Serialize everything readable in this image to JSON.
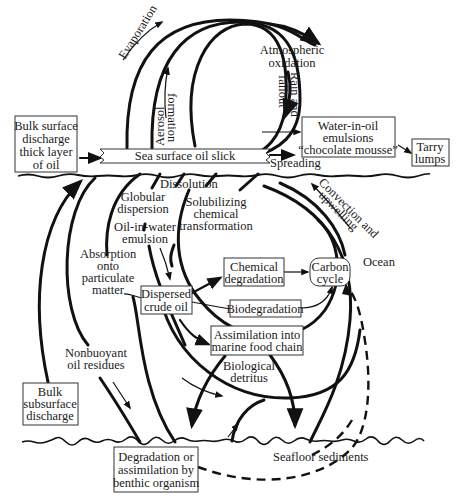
{
  "diagram": {
    "surface": {
      "slick_label": "Sea surface oil slick",
      "spreading_label": "Spreading"
    },
    "atmosphere": {
      "evaporation": "Evaporation",
      "aerosol_line1": "Aerosol",
      "aerosol_line2": "formation",
      "atmo_line1": "Atmospheric",
      "atmo_line2": "oxidation",
      "rain_line1": "Rain and",
      "rain_line2": "fallout"
    },
    "boxes": {
      "bulk_surface": [
        "Bulk surface",
        "discharge",
        "thick layer",
        "of oil"
      ],
      "emulsions": [
        "Water-in-oil",
        "emulsions",
        "“chocolate mousse”"
      ],
      "tarry": [
        "Tarry",
        "lumps"
      ],
      "dispersed": [
        "Dispersed",
        "crude oil"
      ],
      "chemical": [
        "Chemical",
        "degradation"
      ],
      "carbon": [
        "Carbon",
        "cycle"
      ],
      "biodegradation": [
        "Biodegradation"
      ],
      "assimilation": [
        "Assimilation into",
        "marine food chain"
      ],
      "bulk_subsurface": [
        "Bulk",
        "subsurface",
        "discharge"
      ],
      "benthic": [
        "Degradation or",
        "assimilation by",
        "benthic organism"
      ]
    },
    "water_column": {
      "dissolution": "Dissolution",
      "globular": [
        "Globular",
        "dispersion"
      ],
      "solubilizing": [
        "Solubilizing",
        "chemical",
        "transformation"
      ],
      "oil_in_water": [
        "Oil-in-water",
        "emulsion"
      ],
      "absorption": [
        "Absorption",
        "onto",
        "particulate",
        "matter"
      ],
      "convection": [
        "Convection and",
        "upwelling"
      ],
      "ocean": "Ocean",
      "nonbuoyant": [
        "Nonbuoyant",
        "oil residues"
      ],
      "biological": [
        "Biological",
        "detritus"
      ],
      "seafloor": "Seafloor sediments"
    },
    "colors": {
      "ink": "#111111",
      "box_stroke": "#333333",
      "background": "#ffffff"
    }
  }
}
